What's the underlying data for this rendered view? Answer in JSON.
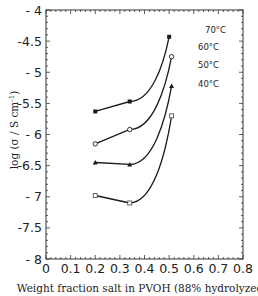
{
  "chart_data": {
    "type": "line",
    "title": "",
    "xlabel": "Weight fraction salt in PVOH (88% hydrolyzed)",
    "ylabel": "log (σ / S cm⁻¹)",
    "xlim": [
      0,
      0.8
    ],
    "ylim": [
      -8,
      -4
    ],
    "x_ticks": [
      "0",
      "0.1",
      "0.2",
      "0.3",
      "0.4",
      "0.5",
      "0.6",
      "0.7",
      "0.8"
    ],
    "y_ticks": [
      "- 4",
      "-4.5",
      "- 5",
      "-5.5",
      "- 6",
      "-6.5",
      "- 7",
      "-7.5",
      "- 8"
    ],
    "grid": false,
    "legend_position": "inline labels at right end of curves",
    "series": [
      {
        "name": "70°C",
        "marker": "filled-square",
        "x": [
          0.2,
          0.34,
          0.5
        ],
        "values": [
          -5.63,
          -5.47,
          -4.43
        ]
      },
      {
        "name": "60°C",
        "marker": "open-circle",
        "x": [
          0.2,
          0.34,
          0.51
        ],
        "values": [
          -6.15,
          -5.92,
          -4.75
        ]
      },
      {
        "name": "50°C",
        "marker": "filled-triangle",
        "x": [
          0.2,
          0.34,
          0.51
        ],
        "values": [
          -6.45,
          -6.48,
          -5.22
        ]
      },
      {
        "name": "40°C",
        "marker": "open-square",
        "x": [
          0.2,
          0.34,
          0.51
        ],
        "values": [
          -6.98,
          -7.1,
          -5.7
        ]
      }
    ]
  },
  "colors": {
    "line": "#1a1a1a",
    "axis": "#333333",
    "background": "#ffffff"
  }
}
